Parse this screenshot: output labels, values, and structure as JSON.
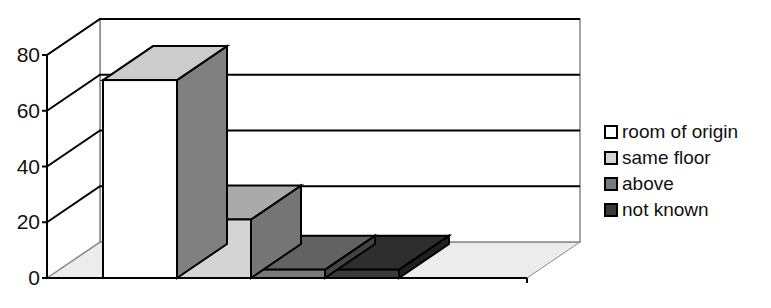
{
  "chart_data": {
    "type": "bar",
    "style": "3d-column",
    "title": "",
    "xlabel": "",
    "ylabel": "",
    "categories": [
      "room of origin",
      "same floor",
      "above",
      "not known"
    ],
    "values": [
      71,
      21,
      3,
      3
    ],
    "ylim": [
      0,
      80
    ],
    "yticks": [
      0,
      20,
      40,
      60,
      80
    ],
    "ytick_labels": [
      "0",
      "20",
      "40",
      "60",
      "80"
    ],
    "grid": true,
    "legend": {
      "position": "right",
      "entries": [
        {
          "label": "room of origin",
          "color": "#ffffff"
        },
        {
          "label": "same floor",
          "color": "#d4d4d4"
        },
        {
          "label": "above",
          "color": "#7a7a7a"
        },
        {
          "label": "not known",
          "color": "#3a3a3a"
        }
      ]
    },
    "colors": {
      "floor": "#ececec",
      "wall": "#ffffff",
      "axis": "#000000",
      "wall_edge": "#888888"
    }
  }
}
